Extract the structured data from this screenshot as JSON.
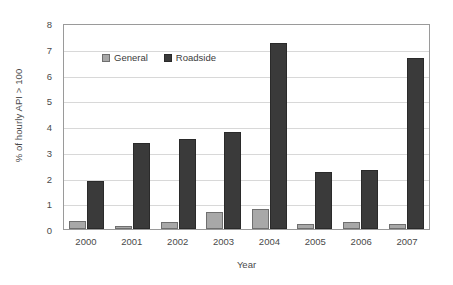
{
  "chart_data": {
    "type": "bar",
    "title": "",
    "xlabel": "Year",
    "ylabel": "% of hourly API > 100",
    "categories": [
      "2000",
      "2001",
      "2002",
      "2003",
      "2004",
      "2005",
      "2006",
      "2007"
    ],
    "series": [
      {
        "name": "General",
        "color": "#a8a8a8",
        "values": [
          0.32,
          0.13,
          0.26,
          0.68,
          0.76,
          0.21,
          0.28,
          0.2
        ]
      },
      {
        "name": "Roadside",
        "color": "#3a3a3a",
        "values": [
          1.87,
          3.35,
          3.48,
          3.75,
          7.22,
          2.2,
          2.28,
          6.65
        ]
      }
    ],
    "ylim": [
      0,
      8
    ],
    "ytick_labels": [
      "0",
      "1",
      "2",
      "3",
      "4",
      "5",
      "6",
      "7",
      "8"
    ],
    "ytick_values": [
      0,
      1,
      2,
      3,
      4,
      5,
      6,
      7,
      8
    ],
    "grid": true,
    "grid_axis": "y",
    "legend_position": "inside-top-left",
    "frame_color": "#9a9a9a",
    "grid_color": "#d8d8d8",
    "background": "#ffffff"
  }
}
